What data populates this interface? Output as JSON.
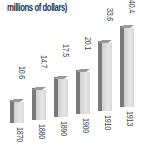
{
  "title": "millions of dollars)",
  "chart_data": {
    "type": "bar",
    "title": "millions of dollars)",
    "xlabel": "",
    "ylabel": "millions of dollars",
    "categories": [
      "1870",
      "1880",
      "1890",
      "1900",
      "1910",
      "1913"
    ],
    "values": [
      10.6,
      14.7,
      17.5,
      20.1,
      33.6,
      40.4
    ],
    "value_labels": [
      "10.6",
      "14.7",
      "17.5",
      "20.1",
      "33.6",
      "40.4"
    ],
    "grid": false,
    "legend": null,
    "style": "3d-bar",
    "bar_color": "#d9d9d9",
    "side_color": "#7a7a7a"
  },
  "bars": [
    {
      "year": "1870",
      "value": "10.6",
      "x": 10,
      "top": 99,
      "bottom": 123,
      "label_top": 66,
      "year_top": 127
    },
    {
      "year": "1880",
      "value": "14.7",
      "x": 32,
      "top": 87,
      "bottom": 120,
      "label_top": 55,
      "year_top": 124
    },
    {
      "year": "1890",
      "value": "17.5",
      "x": 54,
      "top": 76,
      "bottom": 117,
      "label_top": 44,
      "year_top": 121
    },
    {
      "year": "1900",
      "value": "20.1",
      "x": 76,
      "top": 69,
      "bottom": 114,
      "label_top": 37,
      "year_top": 118
    },
    {
      "year": "1910",
      "value": "33.6",
      "x": 98,
      "top": 40,
      "bottom": 111,
      "label_top": 8,
      "year_top": 115
    },
    {
      "year": "1913",
      "value": "40.4",
      "x": 120,
      "top": 25,
      "bottom": 107,
      "label_top": 0,
      "year_top": 111
    }
  ]
}
